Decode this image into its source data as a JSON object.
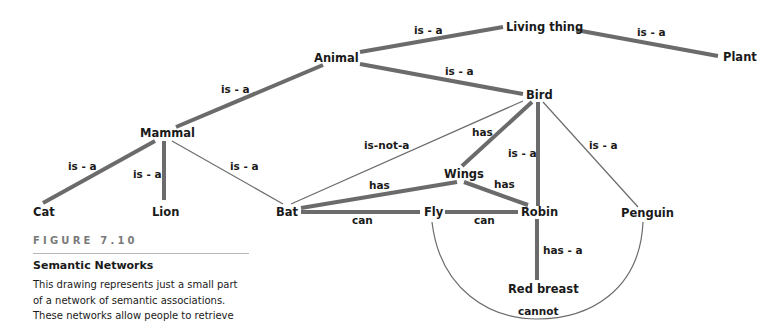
{
  "figure": {
    "number": "FIGURE 7.10",
    "title": "Semantic Networks",
    "body_lines": [
      "This drawing represents just a small part",
      "of a network of semantic associations.",
      "These networks allow people to retrieve"
    ]
  },
  "nodes": {
    "living_thing": "Living thing",
    "animal": "Animal",
    "plant": "Plant",
    "bird": "Bird",
    "mammal": "Mammal",
    "cat": "Cat",
    "lion": "Lion",
    "bat": "Bat",
    "wings": "Wings",
    "fly": "Fly",
    "robin": "Robin",
    "penguin": "Penguin",
    "red_breast": "Red breast"
  },
  "edges": {
    "animal_living_thing": "is - a",
    "plant_living_thing": "is - a",
    "bird_animal": "is - a",
    "mammal_animal": "is - a",
    "cat_mammal": "is - a",
    "lion_mammal": "is - a",
    "bat_mammal": "is - a",
    "bat_bird": "is-not-a",
    "bird_wings": "has",
    "robin_bird": "is - a",
    "penguin_bird": "is - a",
    "bat_wings": "has",
    "robin_wings": "has",
    "bat_fly": "can",
    "robin_fly": "can",
    "robin_red_breast": "has - a",
    "penguin_fly": "cannot"
  },
  "colors": {
    "edge": "#6b6b6b",
    "text": "#1a1a1a",
    "caption_label": "#7a7a7a",
    "rule": "#b8b8b8"
  }
}
